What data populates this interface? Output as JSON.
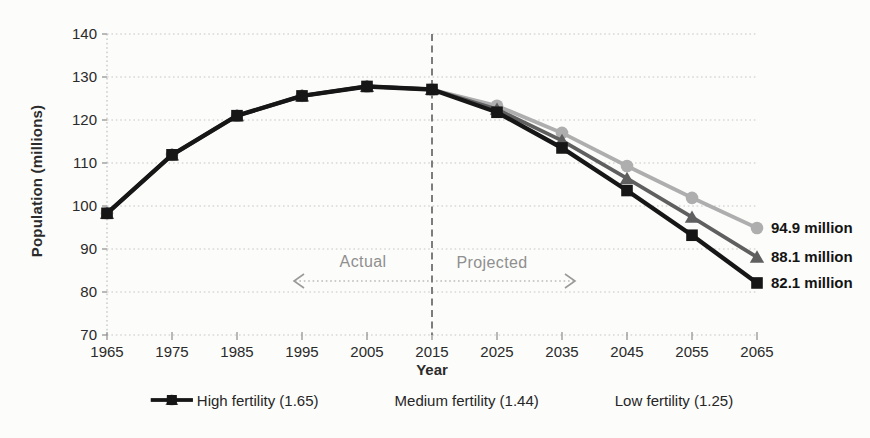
{
  "chart_data": {
    "type": "line",
    "title": "",
    "xlabel": "Year",
    "ylabel": "Population (millions)",
    "xlim": [
      1965,
      2065
    ],
    "ylim": [
      70,
      140
    ],
    "y_ticks": [
      70,
      80,
      90,
      100,
      110,
      120,
      130,
      140
    ],
    "x_ticks": [
      1965,
      1975,
      1985,
      1995,
      2005,
      2015,
      2025,
      2035,
      2045,
      2055,
      2065
    ],
    "grid": "horizontal-dotted",
    "legend_position": "bottom",
    "divider_year": 2015,
    "annotations": {
      "actual": "Actual",
      "projected": "Projected"
    },
    "x": [
      1965,
      1975,
      1985,
      1995,
      2005,
      2015,
      2025,
      2035,
      2045,
      2055,
      2065
    ],
    "series": [
      {
        "name": "High fertility (1.65)",
        "marker": "circle",
        "color": "#aeaeae",
        "values": [
          98.3,
          111.9,
          121.0,
          125.6,
          127.8,
          127.1,
          123.3,
          117.0,
          109.3,
          101.9,
          94.9
        ],
        "end_label": "94.9 million"
      },
      {
        "name": "Medium fertility (1.44)",
        "marker": "triangle",
        "color": "#5f5f5f",
        "values": [
          98.3,
          111.9,
          121.0,
          125.6,
          127.8,
          127.1,
          122.5,
          115.2,
          106.4,
          97.4,
          88.1
        ],
        "end_label": "88.1 million"
      },
      {
        "name": "Low fertility (1.25)",
        "marker": "square",
        "color": "#161616",
        "values": [
          98.3,
          111.9,
          121.0,
          125.6,
          127.8,
          127.1,
          121.8,
          113.5,
          103.6,
          93.2,
          82.1
        ],
        "end_label": "82.1 million"
      }
    ],
    "colors": {
      "gridline": "#c6c6c6",
      "axis": "#b3b3b3",
      "tick": "#8c8c8c",
      "divider": "#7d7d7d",
      "annotation_arrow": "#9a9a9a",
      "tick_text": "#2a2a2a"
    }
  }
}
